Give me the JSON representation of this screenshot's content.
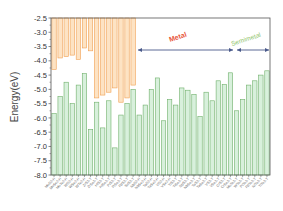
{
  "chart_data": {
    "type": "bar",
    "title": "",
    "xlabel": "",
    "ylabel": "Energy(eV)",
    "ylim": [
      -8.0,
      -2.5
    ],
    "yticks": [
      "-2.5",
      "-3.0",
      "-3.5",
      "-4.0",
      "-4.5",
      "-5.0",
      "-5.5",
      "-6.0",
      "-6.5",
      "-7.0",
      "-7.5",
      "-8.0"
    ],
    "grid": false,
    "legend": null,
    "categories": [
      "MoS2-H",
      "MoSe2-H",
      "MoTe2-H",
      "WS2-H",
      "WSe2-H",
      "WTe2-H",
      "ZrS2-T",
      "ZrSe2-T",
      "HfS2-T",
      "HfSe2-T",
      "PtS2-T",
      "PtSe2-T",
      "PdS2-T",
      "SnS2-T",
      "NbS2-H",
      "NbSe2-H",
      "TaS2-H",
      "TaSe2-H",
      "VS2-H",
      "VSe2-H",
      "TiS2-T",
      "TiSe2-T",
      "NbS2-T",
      "NbSe2-T",
      "TaS2-T",
      "TaSe2-T",
      "VS2-T",
      "VSe2-T",
      "CrS2-T",
      "CrSe2-T",
      "MoTe2-T",
      "WTe2-T",
      "PtTe2-T",
      "PdTe2-T",
      "NiTe2-T",
      "TiTe2-T"
    ],
    "series": [
      {
        "name": "Conduction band edge (CBM)",
        "color": "#f2a65a",
        "values": [
          -4.3,
          -3.9,
          -3.85,
          -3.8,
          -3.95,
          -3.55,
          -3.65,
          -5.3,
          -5.2,
          -5.1,
          -4.95,
          -5.45,
          -5.3,
          -4.85,
          null,
          null,
          null,
          null,
          null,
          null,
          null,
          null,
          null,
          null,
          null,
          null,
          null,
          null,
          null,
          null,
          null,
          null,
          null,
          null,
          null,
          null
        ]
      },
      {
        "name": "Valence band edge / Work function",
        "color": "#7cbf7a",
        "values": [
          -5.85,
          -5.25,
          -4.75,
          -5.5,
          -4.85,
          -4.45,
          -6.4,
          -5.45,
          -6.35,
          -5.4,
          -7.05,
          -5.9,
          -5.5,
          -5.0,
          -5.9,
          -5.55,
          -5.0,
          -4.6,
          -6.1,
          -5.35,
          -5.55,
          -4.95,
          -5.03,
          -5.18,
          -5.95,
          -5.1,
          -5.4,
          -4.7,
          -4.83,
          -4.42,
          -5.75,
          -5.35,
          -4.85,
          -4.7,
          -4.5,
          -4.35
        ]
      }
    ],
    "annotations": [
      {
        "text": "Metal",
        "color": "#e8553a",
        "span_categories": [
          14,
          29
        ]
      },
      {
        "text": "Semimetal",
        "color": "#8fc46a",
        "span_categories": [
          30,
          35
        ]
      }
    ]
  },
  "annotations": {
    "metal_label": "Metal",
    "semimetal_label": "Semimetal"
  },
  "axis": {
    "ylabel": "Energy(eV)"
  }
}
